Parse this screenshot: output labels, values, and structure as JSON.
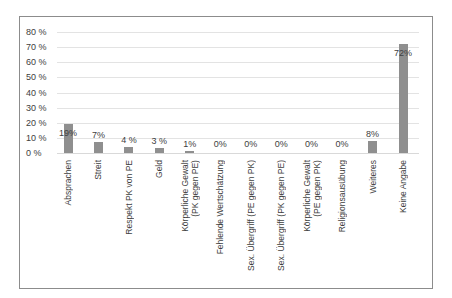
{
  "chart_data": {
    "type": "bar",
    "title": "",
    "xlabel": "",
    "ylabel": "",
    "ylim": [
      0,
      80
    ],
    "yticks": [
      "0 %",
      "10 %",
      "20 %",
      "30 %",
      "40 %",
      "50 %",
      "60 %",
      "70 %",
      "80 %"
    ],
    "grid": true,
    "legend": "none",
    "categories": [
      "Absprachen",
      "Streit",
      "Respekt PK von PE",
      "Geld",
      "Körperliche Gewalt\n(PK gegen PE)",
      "Fehlende Wertschätzung",
      "Sex. Übergriff (PE gegen PK)",
      "Sex. Übergriff (PK gegen PE)",
      "Körperliche Gewalt\n(PE gegen PK)",
      "Religionsausübung",
      "Weiteres",
      "Keine Angabe"
    ],
    "values": [
      19,
      7,
      4,
      3,
      1,
      0,
      0,
      0,
      0,
      0,
      8,
      72
    ],
    "data_labels": [
      "19%",
      "7%",
      "4 %",
      "3 %",
      "1%",
      "0%",
      "0%",
      "0%",
      "0%",
      "0%",
      "8%",
      "72%"
    ],
    "bar_color": "#8f8f8f"
  }
}
